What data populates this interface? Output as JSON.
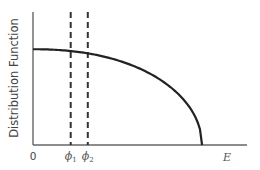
{
  "diagram": {
    "ylabel": "Distribution Function",
    "xlabel": "E",
    "origin_label": "0",
    "markers": [
      {
        "symbol": "ϕ",
        "subscript": "1",
        "position_fraction": 0.22
      },
      {
        "symbol": "ϕ",
        "subscript": "2",
        "position_fraction": 0.32
      }
    ],
    "curve": {
      "description": "Distribution function starting flat near 0.72 of axis height and falling to zero at E_max (~0.8 of x-axis length), shaped like an inverted parabola/ellipse",
      "start_level_fraction": 0.72,
      "zero_at_fraction": 0.79
    },
    "colors": {
      "curve": "#222222",
      "axes": "#555555",
      "dashes": "#333333"
    }
  }
}
